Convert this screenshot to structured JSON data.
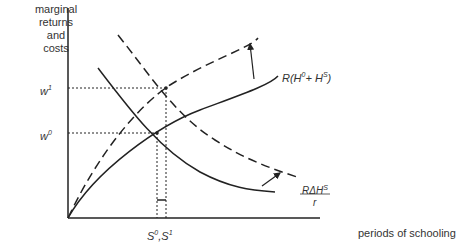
{
  "diagram": {
    "y_axis_label_lines": [
      "marginal",
      "returns",
      "and",
      "costs"
    ],
    "x_axis_label": "periods of schooling",
    "y_ticks": [
      {
        "base": "w",
        "sup": "1"
      },
      {
        "base": "w",
        "sup": "0"
      }
    ],
    "x_tick": {
      "s0": "S",
      "s0_sup": "0",
      "sep": ",",
      "s1": "S",
      "s1_sup": "1"
    },
    "curve_return": {
      "prefix": "R(H",
      "sup0": "0",
      "mid": "+ H",
      "supS": "S",
      "suffix": ")"
    },
    "curve_cost": {
      "numer": "RΔH",
      "numer_sup": "S",
      "denom": "r"
    },
    "colors": {
      "line": "#222222",
      "background": "#ffffff"
    }
  }
}
